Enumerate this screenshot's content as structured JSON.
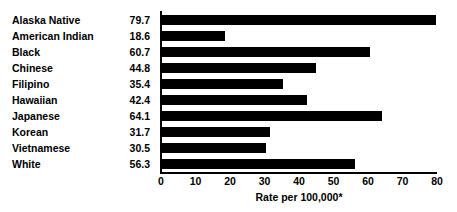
{
  "chart_data": {
    "type": "bar",
    "orientation": "horizontal",
    "title": "",
    "xlabel": "Rate per 100,000*",
    "ylabel": "",
    "xlim": [
      0,
      80
    ],
    "xticks": [
      0,
      10,
      20,
      30,
      40,
      50,
      60,
      70,
      80
    ],
    "grid": false,
    "legend": false,
    "bar_color": "#000000",
    "background_color": "#ffffff",
    "categories": [
      "Alaska Native",
      "American Indian",
      "Black",
      "Chinese",
      "Filipino",
      "Hawaiian",
      "Japanese",
      "Korean",
      "Vietnamese",
      "White"
    ],
    "values": [
      79.7,
      18.6,
      60.7,
      44.8,
      35.4,
      42.4,
      64.1,
      31.7,
      30.5,
      56.3
    ],
    "value_labels": [
      "79.7",
      "18.6",
      "60.7",
      "44.8",
      "35.4",
      "42.4",
      "64.1",
      "31.7",
      "30.5",
      "56.3"
    ],
    "tick_labels": [
      "0",
      "10",
      "20",
      "30",
      "40",
      "50",
      "60",
      "70",
      "80"
    ]
  }
}
